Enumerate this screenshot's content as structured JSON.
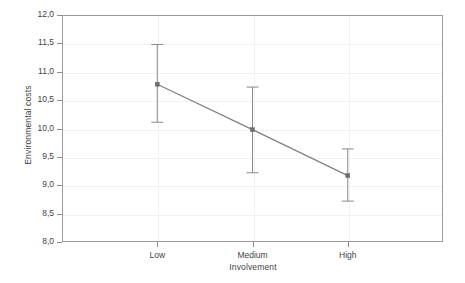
{
  "chart_data": {
    "type": "line",
    "title": "",
    "xlabel": "Involvement",
    "ylabel": "Environmental costs",
    "categories": [
      "Low",
      "Medium",
      "High"
    ],
    "values": [
      10.78,
      9.98,
      9.17
    ],
    "error_low": [
      10.11,
      9.22,
      8.72
    ],
    "error_high": [
      11.48,
      10.73,
      9.64
    ],
    "series": [
      {
        "name": "Environmental costs",
        "values": [
          10.78,
          9.98,
          9.17
        ],
        "error_low": [
          10.11,
          9.22,
          8.72
        ],
        "error_high": [
          11.48,
          10.73,
          9.64
        ]
      }
    ],
    "ylim": [
      8.0,
      12.0
    ],
    "ytick_step": 0.5,
    "ytick_labels": [
      "12,0",
      "11,5",
      "11,0",
      "10,5",
      "10,0",
      "9,5",
      "9,0",
      "8,5",
      "8,0"
    ],
    "ytick_values": [
      12.0,
      11.5,
      11.0,
      10.5,
      10.0,
      9.5,
      9.0,
      8.5,
      8.0
    ],
    "decimal_separator": ",",
    "grid": true,
    "legend": "none",
    "error_bar_type": "confidence-interval",
    "marker": "square",
    "colors": {
      "line": "#808080",
      "marker": "#6e6e6e",
      "error_bar": "#8a8a8a",
      "axis": "#9a9a9a",
      "grid": "#f2f2f2",
      "text": "#3f3f3f",
      "background": "#ffffff"
    }
  }
}
